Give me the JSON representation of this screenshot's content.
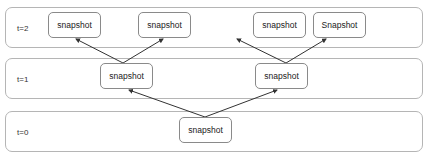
{
  "lanes": [
    {
      "label": "t=2",
      "top": 7
    },
    {
      "label": "t=1",
      "top": 58
    },
    {
      "label": "t=0",
      "top": 111
    }
  ],
  "nodes": {
    "t2": [
      {
        "label": "snapshot",
        "x": 48,
        "y": 12
      },
      {
        "label": "snapshot",
        "x": 138,
        "y": 12
      },
      {
        "label": "snapshot",
        "x": 253,
        "y": 12
      },
      {
        "label": "Snapshot",
        "x": 313,
        "y": 12
      }
    ],
    "t1": [
      {
        "label": "snapshot",
        "x": 100,
        "y": 63
      },
      {
        "label": "snapshot",
        "x": 260,
        "y": 63
      }
    ],
    "t0": [
      {
        "label": "snapshot",
        "x": 179,
        "y": 117
      }
    ]
  },
  "edges": [
    {
      "from": "t1.0",
      "to": "t2.0"
    },
    {
      "from": "t1.0",
      "to": "t2.1"
    },
    {
      "from": "t1.1",
      "to": "t2.2"
    },
    {
      "from": "t1.1",
      "to": "t2.3"
    },
    {
      "from": "t0.0",
      "to": "t1.0"
    },
    {
      "from": "t0.0",
      "to": "t1.1"
    }
  ],
  "colors": {
    "lane_border": "#b5b5b5",
    "node_border": "#8a8a8a",
    "arrow": "#333333"
  }
}
